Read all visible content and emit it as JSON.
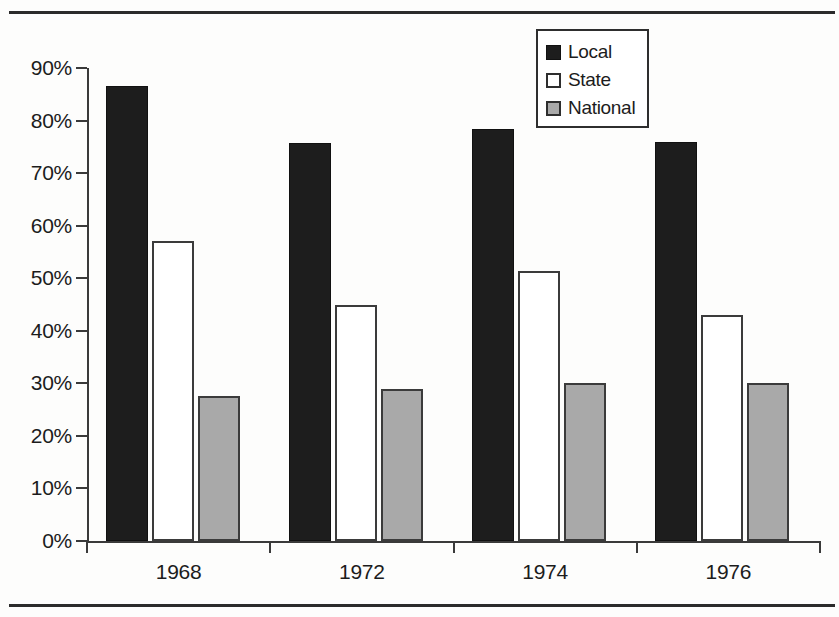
{
  "chart_data": {
    "type": "bar",
    "title": "",
    "subtitle": "",
    "xlabel": "",
    "ylabel": "",
    "categories": [
      "1968",
      "1972",
      "1974",
      "1976"
    ],
    "series": [
      {
        "name": "Local",
        "color": "#1d1d1d",
        "swatch_style": "solid-black",
        "values": [
          86.5,
          75.7,
          78.4,
          76.0
        ]
      },
      {
        "name": "State",
        "color": "#ffffff",
        "swatch_style": "outline-white",
        "values": [
          57.0,
          45.0,
          51.3,
          43.0
        ]
      },
      {
        "name": "National",
        "color": "#a9a9a9",
        "swatch_style": "solid-gray",
        "values": [
          27.5,
          29.0,
          30.0,
          30.0
        ]
      }
    ],
    "ylim": [
      0,
      90
    ],
    "ytick_values": [
      0,
      10,
      20,
      30,
      40,
      50,
      60,
      70,
      80,
      90
    ],
    "ytick_labels": [
      "0%",
      "10%",
      "20%",
      "30%",
      "40%",
      "50%",
      "60%",
      "70%",
      "80%",
      "90%"
    ],
    "grid": false,
    "legend_position": "top-right",
    "axis_color": "#3a3a3a",
    "background_color": "#fdfdfc"
  },
  "legend": {
    "items": [
      {
        "label": "Local"
      },
      {
        "label": "State"
      },
      {
        "label": "National"
      }
    ]
  },
  "rules": {
    "top_rule": "horizontal-rule-top",
    "bottom_rule": "horizontal-rule-bottom"
  }
}
